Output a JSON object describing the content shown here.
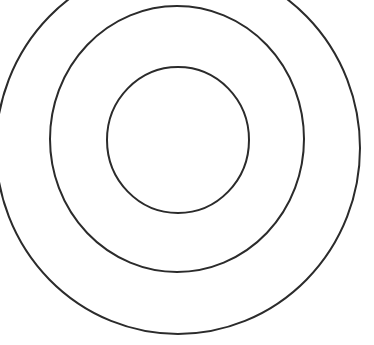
{
  "diagram": {
    "title": "",
    "type": "concentric-circles",
    "background": "#ffffff",
    "stroke_color": "#2b2b2b",
    "stroke_width": 2,
    "rings": [
      {
        "name": "outer-ring",
        "cx": 178,
        "cy": 148,
        "rx": 182,
        "ry": 186
      },
      {
        "name": "middle-ring",
        "cx": 177,
        "cy": 139,
        "rx": 127,
        "ry": 133
      },
      {
        "name": "inner-ring",
        "cx": 178,
        "cy": 140,
        "rx": 71,
        "ry": 73
      }
    ]
  }
}
